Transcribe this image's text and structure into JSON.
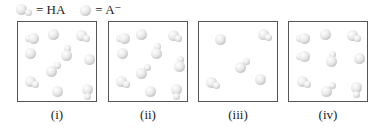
{
  "legend": {
    "items": [
      {
        "icon": "ha-molecule-icon",
        "label": "= HA"
      },
      {
        "icon": "a-minus-ion-icon",
        "label": "= A⁻"
      }
    ]
  },
  "colors": {
    "particle": "#d8d8d8",
    "border": "#555555",
    "text": "#222222"
  },
  "panels": [
    {
      "label": "(i)",
      "left": 17,
      "ha_count": 6,
      "a_count": 4,
      "particles": [
        {
          "type": "HA",
          "x": 10,
          "y": 8,
          "o": "left"
        },
        {
          "type": "A",
          "x": 30,
          "y": 7
        },
        {
          "type": "HA",
          "x": 58,
          "y": 8,
          "o": "down"
        },
        {
          "type": "A",
          "x": 7,
          "y": 26
        },
        {
          "type": "HA",
          "x": 43,
          "y": 24,
          "o": "up"
        },
        {
          "type": "A",
          "x": 66,
          "y": 32
        },
        {
          "type": "HA",
          "x": 28,
          "y": 41,
          "o": "diag"
        },
        {
          "type": "HA",
          "x": 7,
          "y": 54,
          "o": "down"
        },
        {
          "type": "A",
          "x": 34,
          "y": 64
        },
        {
          "type": "HA",
          "x": 64,
          "y": 62,
          "o": "vdown"
        }
      ]
    },
    {
      "label": "(ii)",
      "left": 108,
      "ha_count": 7,
      "a_count": 3,
      "particles": [
        {
          "type": "HA",
          "x": 10,
          "y": 8,
          "o": "left"
        },
        {
          "type": "A",
          "x": 27,
          "y": 7
        },
        {
          "type": "HA",
          "x": 59,
          "y": 8,
          "o": "down"
        },
        {
          "type": "A",
          "x": 8,
          "y": 26
        },
        {
          "type": "HA",
          "x": 42,
          "y": 22,
          "o": "up"
        },
        {
          "type": "HA",
          "x": 65,
          "y": 35,
          "o": "up"
        },
        {
          "type": "HA",
          "x": 27,
          "y": 43,
          "o": "diag"
        },
        {
          "type": "HA",
          "x": 7,
          "y": 54,
          "o": "down"
        },
        {
          "type": "A",
          "x": 36,
          "y": 64
        },
        {
          "type": "HA",
          "x": 62,
          "y": 62,
          "o": "vdown"
        }
      ]
    },
    {
      "label": "(iii)",
      "left": 198,
      "ha_count": 3,
      "a_count": 2,
      "particles": [
        {
          "type": "A",
          "x": 16,
          "y": 12
        },
        {
          "type": "HA",
          "x": 59,
          "y": 7,
          "o": "down"
        },
        {
          "type": "HA",
          "x": 36,
          "y": 37,
          "o": "diag"
        },
        {
          "type": "HA",
          "x": 7,
          "y": 55,
          "o": "down"
        },
        {
          "type": "A",
          "x": 56,
          "y": 52
        }
      ]
    },
    {
      "label": "(iv)",
      "left": 288,
      "ha_count": 7,
      "a_count": 2,
      "particles": [
        {
          "type": "HA",
          "x": 10,
          "y": 8,
          "o": "left"
        },
        {
          "type": "A",
          "x": 31,
          "y": 7
        },
        {
          "type": "HA",
          "x": 58,
          "y": 8,
          "o": "down"
        },
        {
          "type": "HA",
          "x": 10,
          "y": 26,
          "o": "left"
        },
        {
          "type": "HA",
          "x": 37,
          "y": 30,
          "o": "up"
        },
        {
          "type": "A",
          "x": 65,
          "y": 31
        },
        {
          "type": "HA",
          "x": 8,
          "y": 54,
          "o": "down"
        },
        {
          "type": "HA",
          "x": 32,
          "y": 61,
          "o": "diag"
        },
        {
          "type": "HA",
          "x": 62,
          "y": 60,
          "o": "vdown"
        }
      ]
    }
  ]
}
